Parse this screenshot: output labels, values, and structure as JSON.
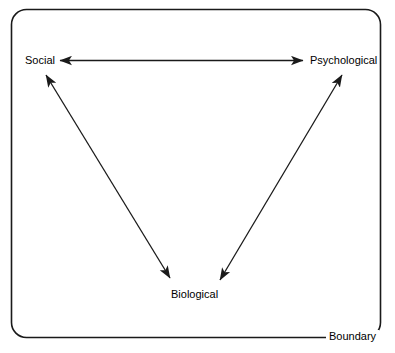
{
  "diagram": {
    "type": "biopsychosocial-model",
    "title": "",
    "boundary": {
      "label": "Boundary",
      "shape": "rounded-rectangle",
      "stroke_color": "#1a1a1a"
    },
    "nodes": [
      {
        "id": "social",
        "label": "Social",
        "x": 42,
        "y": 60
      },
      {
        "id": "psychological",
        "label": "Psychological",
        "x": 346,
        "y": 60
      },
      {
        "id": "biological",
        "label": "Biological",
        "x": 195,
        "y": 294
      }
    ],
    "edges": [
      {
        "id": "social-psychological",
        "from": "social",
        "to": "psychological",
        "arrow": "double",
        "style": "straight"
      },
      {
        "id": "social-biological",
        "from": "social",
        "to": "biological",
        "arrow": "double",
        "style": "straight"
      },
      {
        "id": "psychological-biological",
        "from": "psychological",
        "to": "biological",
        "arrow": "double",
        "style": "straight"
      }
    ],
    "colors": {
      "stroke": "#1a1a1a",
      "background": "#ffffff",
      "text": "#000000"
    }
  }
}
